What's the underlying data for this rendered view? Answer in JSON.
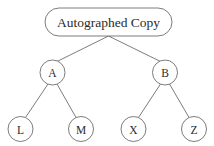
{
  "diagram": {
    "type": "tree",
    "background_color": "#ffffff",
    "stroke_color": "#5a5a5a",
    "text_color": "#2b2b2b",
    "nodes": {
      "root": {
        "id": "root",
        "label": "Autographed Copy",
        "shape": "rounded-rectangle",
        "cx": 108.5,
        "cy": 22,
        "width": 127,
        "height": 28,
        "rx": 14
      },
      "a": {
        "id": "A",
        "label": "A",
        "shape": "circle",
        "cx": 52.5,
        "cy": 72.5,
        "r": 12.5
      },
      "b": {
        "id": "B",
        "label": "B",
        "shape": "circle",
        "cx": 165,
        "cy": 72.5,
        "r": 12.5
      },
      "l": {
        "id": "L",
        "label": "L",
        "shape": "circle",
        "cx": 20.5,
        "cy": 129,
        "r": 12.5
      },
      "m": {
        "id": "M",
        "label": "M",
        "shape": "circle",
        "cx": 81,
        "cy": 129,
        "r": 12.5
      },
      "x": {
        "id": "X",
        "label": "X",
        "shape": "circle",
        "cx": 133.5,
        "cy": 129,
        "r": 12.5
      },
      "z": {
        "id": "Z",
        "label": "Z",
        "shape": "circle",
        "cx": 194,
        "cy": 129,
        "r": 12.5
      }
    },
    "edges": [
      {
        "id": "root-a",
        "from": "root",
        "to": "A",
        "x1": 108.5,
        "y1": 36,
        "x2": 57,
        "y2": 61.5
      },
      {
        "id": "root-b",
        "from": "root",
        "to": "B",
        "x1": 108.5,
        "y1": 36,
        "x2": 160.5,
        "y2": 61.5
      },
      {
        "id": "a-l",
        "from": "A",
        "to": "L",
        "x1": 48,
        "y1": 84,
        "x2": 25.5,
        "y2": 117.5
      },
      {
        "id": "a-m",
        "from": "A",
        "to": "M",
        "x1": 57,
        "y1": 84,
        "x2": 76,
        "y2": 117.5
      },
      {
        "id": "b-x",
        "from": "B",
        "to": "X",
        "x1": 160.5,
        "y1": 84,
        "x2": 138.5,
        "y2": 117.5
      },
      {
        "id": "b-z",
        "from": "B",
        "to": "Z",
        "x1": 169.5,
        "y1": 84,
        "x2": 189,
        "y2": 117.5
      }
    ]
  }
}
